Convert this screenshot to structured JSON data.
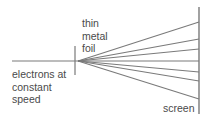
{
  "diagram": {
    "labels": {
      "foil": "thin\nmetal\nfoil",
      "electrons": "electrons at\nconstant\nspeed",
      "screen": "screen"
    },
    "colors": {
      "line": "#7a7a7a",
      "text": "#4a4a4a"
    },
    "geometry": {
      "incoming_beam": {
        "x1": 12,
        "y1": 61,
        "x2": 78,
        "y2": 61
      },
      "foil": {
        "x": 75,
        "y1": 46,
        "y2": 75
      },
      "screen": {
        "x": 199,
        "y1": 7,
        "y2": 114
      },
      "scatter_origin": {
        "x": 78,
        "y": 61
      },
      "scatter_endpoints_y": [
        22,
        39,
        49,
        61,
        72,
        81,
        99
      ]
    }
  }
}
